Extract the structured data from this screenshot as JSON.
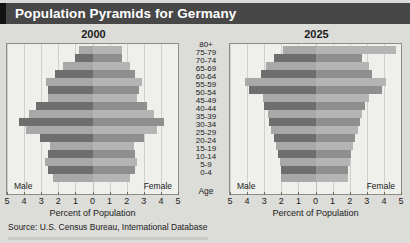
{
  "header": {
    "title": "Population Pyramids for Germany"
  },
  "source": {
    "text": "Source: U.S. Census Bureau, International Database"
  },
  "labels": {
    "male": "Male",
    "female": "Female",
    "age": "Age",
    "xlabel": "Percent of Population"
  },
  "colors": {
    "header_bg": "#474747",
    "header_text": "#ffffff",
    "page_bg": "#dcdcd8",
    "plot_bg": "#efefec",
    "bar_dark": "#6e6e6e",
    "bar_light": "#a8a8a8",
    "grid": "#cfcfcb"
  },
  "chart_data": [
    {
      "type": "bar",
      "title": "2000",
      "orientation": "population-pyramid",
      "xlabel": "Percent of Population",
      "ylabel": "Age",
      "xlim": [
        -5,
        5
      ],
      "xticks": [
        "5",
        "4",
        "3",
        "2",
        "1",
        "0",
        "1",
        "2",
        "3",
        "4",
        "5"
      ],
      "grid": true,
      "categories": [
        "0-4",
        "5-9",
        "10-14",
        "15-19",
        "20-24",
        "25-29",
        "30-34",
        "35-39",
        "40-44",
        "45-49",
        "50-54",
        "55-59",
        "60-64",
        "65-69",
        "70-74",
        "75-79",
        "80+"
      ],
      "series": [
        {
          "name": "Male",
          "values": [
            2.3,
            2.6,
            2.8,
            2.6,
            2.5,
            3.1,
            3.9,
            4.3,
            3.7,
            3.3,
            2.6,
            2.6,
            2.7,
            2.2,
            1.7,
            1.0,
            0.8
          ]
        },
        {
          "name": "Female",
          "values": [
            2.2,
            2.5,
            2.6,
            2.5,
            2.4,
            3.0,
            3.8,
            4.2,
            3.6,
            3.2,
            2.6,
            2.7,
            2.9,
            2.5,
            2.2,
            1.7,
            1.7
          ]
        }
      ]
    },
    {
      "type": "bar",
      "title": "2025",
      "orientation": "population-pyramid",
      "xlabel": "Percent of Population",
      "ylabel": "Age",
      "xlim": [
        -5,
        5
      ],
      "xticks": [
        "5",
        "4",
        "3",
        "2",
        "1",
        "0",
        "1",
        "2",
        "3",
        "4",
        "5"
      ],
      "grid": true,
      "categories": [
        "0-4",
        "5-9",
        "10-14",
        "15-19",
        "20-24",
        "25-29",
        "30-34",
        "35-39",
        "40-44",
        "45-49",
        "50-54",
        "55-59",
        "60-64",
        "65-69",
        "70-74",
        "75-79",
        "80+"
      ],
      "series": [
        {
          "name": "Male",
          "values": [
            2.0,
            2.0,
            2.1,
            2.2,
            2.3,
            2.4,
            2.6,
            2.7,
            2.8,
            3.0,
            3.1,
            3.9,
            4.1,
            3.2,
            2.9,
            2.4,
            1.9
          ]
        },
        {
          "name": "Female",
          "values": [
            1.9,
            1.9,
            2.0,
            2.1,
            2.2,
            2.3,
            2.5,
            2.6,
            2.7,
            2.9,
            3.1,
            3.9,
            4.1,
            3.3,
            3.1,
            2.7,
            4.7
          ]
        }
      ]
    }
  ]
}
